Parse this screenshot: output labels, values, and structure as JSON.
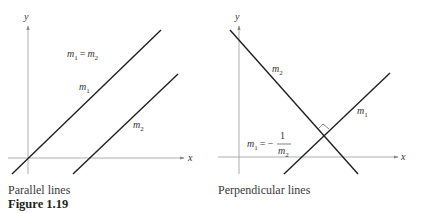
{
  "figure": {
    "label": "Figure 1.19",
    "panels": [
      {
        "caption": "Parallel lines",
        "axes": {
          "x_label": "x",
          "y_label": "y"
        },
        "lines": [
          {
            "name": "m",
            "subscript": "1"
          },
          {
            "name": "m",
            "subscript": "2"
          }
        ],
        "relation": {
          "lhs": "m",
          "lhs_sub": "1",
          "op": "=",
          "rhs": "m",
          "rhs_sub": "2"
        }
      },
      {
        "caption": "Perpendicular lines",
        "axes": {
          "x_label": "x",
          "y_label": "y"
        },
        "lines": [
          {
            "name": "m",
            "subscript": "2"
          },
          {
            "name": "m",
            "subscript": "1"
          }
        ],
        "relation": {
          "lhs": "m",
          "lhs_sub": "1",
          "op": "= −",
          "numerator": "1",
          "denominator": "m",
          "denominator_sub": "2"
        }
      }
    ]
  }
}
